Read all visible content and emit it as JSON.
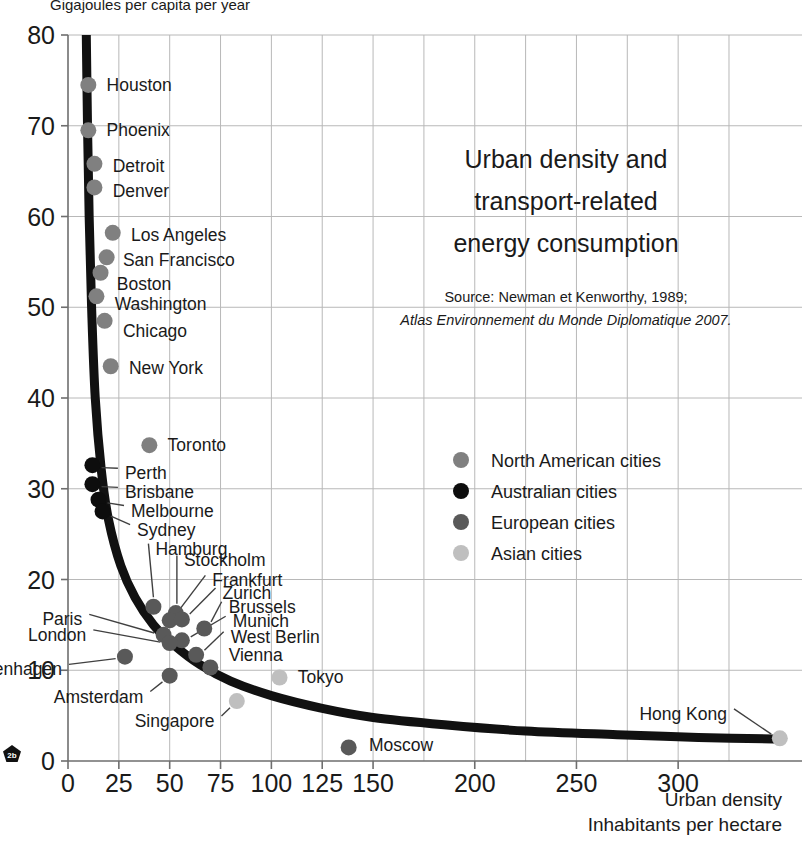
{
  "figure": {
    "top_axis_caption": "Gigajoules per capita per year",
    "title_lines": [
      "Urban density and",
      "transport-related",
      "energy consumption"
    ],
    "source_lines": [
      "Source: Newman et Kenworthy, 1989;",
      "Atlas Environnement du Monde Diplomatique 2007."
    ],
    "x_caption_lines": [
      "Urban density",
      "Inhabitants per hectare"
    ],
    "badge_label": "2b"
  },
  "colors": {
    "north_american": "#808080",
    "australian": "#0d0d0d",
    "european": "#595959",
    "asian": "#bfbfbf",
    "curve": "#111111",
    "grid": "#b8b8b8",
    "axis": "#6e6e6e",
    "text": "#1a1a1a"
  },
  "chart_data": {
    "type": "scatter",
    "subtitle": "Source: Newman et Kenworthy, 1989; Atlas Environnement du Monde Diplomatique 2007.",
    "xlabel": "Urban density — Inhabitants per hectare",
    "ylabel": "Gigajoules per capita per year",
    "xlim": [
      0,
      355
    ],
    "ylim": [
      0,
      80
    ],
    "xticks": [
      0,
      25,
      50,
      75,
      100,
      125,
      150,
      200,
      250,
      300
    ],
    "yticks": [
      0,
      10,
      20,
      30,
      40,
      50,
      60,
      70,
      80
    ],
    "grid": true,
    "legend_position": "center-right",
    "legend": [
      {
        "name": "North American cities",
        "color": "#808080"
      },
      {
        "name": "Australian cities",
        "color": "#0d0d0d"
      },
      {
        "name": "European cities",
        "color": "#595959"
      },
      {
        "name": "Asian cities",
        "color": "#bfbfbf"
      }
    ],
    "series": [
      {
        "name": "North American cities",
        "group": "north_american",
        "color": "#808080",
        "points": [
          {
            "label": "Houston",
            "x": 10,
            "y": 74.5,
            "lx": 18,
            "ly": 74.5
          },
          {
            "label": "Phoenix",
            "x": 10,
            "y": 69.5,
            "lx": 18,
            "ly": 69.5
          },
          {
            "label": "Detroit",
            "x": 13,
            "y": 65.8,
            "lx": 21,
            "ly": 65.6
          },
          {
            "label": "Denver",
            "x": 13,
            "y": 63.2,
            "lx": 21,
            "ly": 62.8
          },
          {
            "label": "Los Angeles",
            "x": 22,
            "y": 58.2,
            "lx": 30,
            "ly": 58.0
          },
          {
            "label": "San Francisco",
            "x": 19,
            "y": 55.5,
            "lx": 26,
            "ly": 55.2
          },
          {
            "label": "Boston",
            "x": 16,
            "y": 53.8,
            "lx": 23,
            "ly": 52.6
          },
          {
            "label": "Washington",
            "x": 14,
            "y": 51.2,
            "lx": 22,
            "ly": 50.4
          },
          {
            "label": "Chicago",
            "x": 18,
            "y": 48.5,
            "lx": 26,
            "ly": 47.4
          },
          {
            "label": "New York",
            "x": 21,
            "y": 43.5,
            "lx": 29,
            "ly": 43.3
          },
          {
            "label": "Toronto",
            "x": 40,
            "y": 34.8,
            "lx": 48,
            "ly": 34.8
          }
        ]
      },
      {
        "name": "Australian cities",
        "group": "australian",
        "color": "#0d0d0d",
        "points": [
          {
            "label": "Perth",
            "x": 12,
            "y": 32.6,
            "lx": 27,
            "ly": 31.7
          },
          {
            "label": "Brisbane",
            "x": 12,
            "y": 30.5,
            "lx": 27,
            "ly": 29.6
          },
          {
            "label": "Melbourne",
            "x": 15,
            "y": 28.8,
            "lx": 30,
            "ly": 27.6
          },
          {
            "label": "Sydney",
            "x": 17,
            "y": 27.5,
            "lx": 33,
            "ly": 25.5
          }
        ]
      },
      {
        "name": "European cities",
        "group": "european",
        "color": "#595959",
        "points": [
          {
            "label": "Hamburg",
            "x": 42,
            "y": 17.0,
            "lx": 42,
            "ly": 23.4
          },
          {
            "label": "Stockholm",
            "x": 53,
            "y": 16.3,
            "lx": 56,
            "ly": 22.1
          },
          {
            "label": "Frankfurt",
            "x": 50,
            "y": 15.5,
            "lx": 70,
            "ly": 19.9
          },
          {
            "label": "Zurich",
            "x": 56,
            "y": 15.6,
            "lx": 75,
            "ly": 18.5
          },
          {
            "label": "Brussels",
            "x": 67,
            "y": 14.6,
            "lx": 78,
            "ly": 17.0
          },
          {
            "label": "Paris",
            "x": 47,
            "y": 13.9,
            "lx": 8,
            "ly": 15.6
          },
          {
            "label": "Munich",
            "x": 56,
            "y": 13.3,
            "lx": 80,
            "ly": 15.4
          },
          {
            "label": "London",
            "x": 50,
            "y": 13.0,
            "lx": 10,
            "ly": 13.9
          },
          {
            "label": "West Berlin",
            "x": 63,
            "y": 11.7,
            "lx": 79,
            "ly": 13.7
          },
          {
            "label": "Vienna",
            "x": 70,
            "y": 10.3,
            "lx": 78,
            "ly": 11.7
          },
          {
            "label": "Copenhagen",
            "x": 28,
            "y": 11.5,
            "lx": -2,
            "ly": 10.1
          },
          {
            "label": "Amsterdam",
            "x": 50,
            "y": 9.4,
            "lx": 38,
            "ly": 7.1
          },
          {
            "label": "Moscow",
            "x": 138,
            "y": 1.5,
            "lx": 147,
            "ly": 1.8
          }
        ]
      },
      {
        "name": "Asian cities",
        "group": "asian",
        "color": "#bfbfbf",
        "points": [
          {
            "label": "Tokyo",
            "x": 104,
            "y": 9.2,
            "lx": 112,
            "ly": 9.3
          },
          {
            "label": "Singapore",
            "x": 83,
            "y": 6.6,
            "lx": 73,
            "ly": 4.4
          },
          {
            "label": "Hong Kong",
            "x": 350,
            "y": 2.5,
            "lx": 325,
            "ly": 5.2
          }
        ]
      }
    ],
    "trend_curve": {
      "description": "Decreasing hyperbolic fit: energy use falls steeply with urban density",
      "points": [
        {
          "x": 9.0,
          "y": 80.0
        },
        {
          "x": 9.6,
          "y": 70.0
        },
        {
          "x": 10.4,
          "y": 60.0
        },
        {
          "x": 11.6,
          "y": 50.0
        },
        {
          "x": 13.4,
          "y": 40.0
        },
        {
          "x": 16.4,
          "y": 32.0
        },
        {
          "x": 20.0,
          "y": 26.5
        },
        {
          "x": 26.0,
          "y": 21.5
        },
        {
          "x": 33.0,
          "y": 18.0
        },
        {
          "x": 42.0,
          "y": 15.0
        },
        {
          "x": 52.0,
          "y": 12.8
        },
        {
          "x": 65.0,
          "y": 10.6
        },
        {
          "x": 80.0,
          "y": 8.8
        },
        {
          "x": 100.0,
          "y": 7.2
        },
        {
          "x": 125.0,
          "y": 5.8
        },
        {
          "x": 150.0,
          "y": 4.8
        },
        {
          "x": 185.0,
          "y": 4.0
        },
        {
          "x": 225.0,
          "y": 3.3
        },
        {
          "x": 270.0,
          "y": 2.9
        },
        {
          "x": 310.0,
          "y": 2.6
        },
        {
          "x": 352.0,
          "y": 2.4
        }
      ]
    }
  }
}
